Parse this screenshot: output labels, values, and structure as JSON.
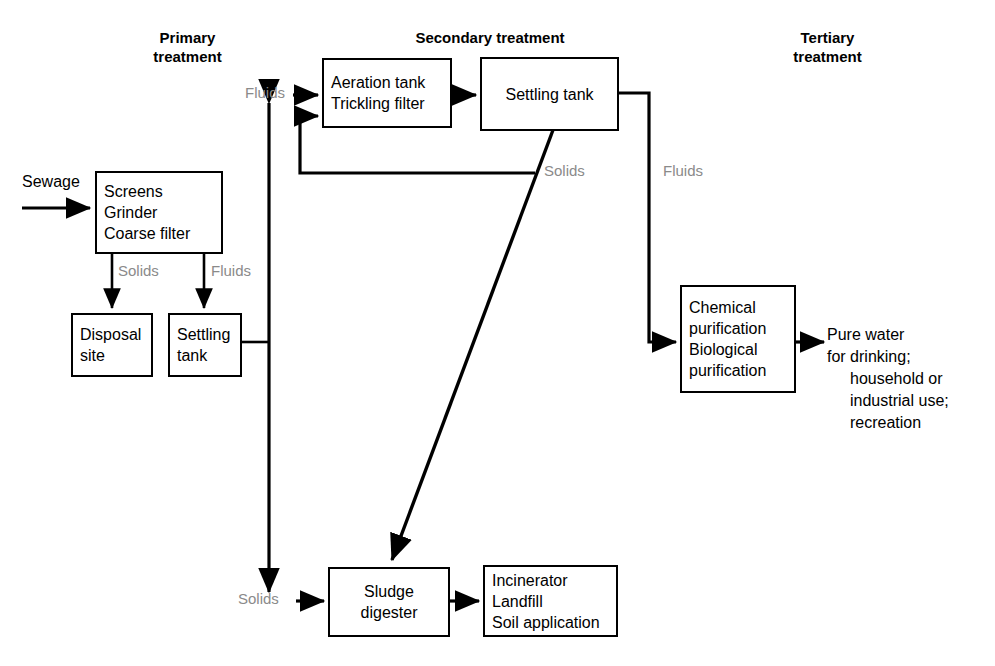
{
  "diagram": {
    "colors": {
      "stroke": "#000000",
      "label_gray": "#8a8a8a",
      "background": "#ffffff"
    },
    "sections": [
      {
        "id": "primary",
        "label": "Primary\ntreatment"
      },
      {
        "id": "secondary",
        "label": "Secondary treatment"
      },
      {
        "id": "tertiary",
        "label": "Tertiary\ntreatment"
      }
    ],
    "nodes": [
      {
        "id": "screens",
        "lines": [
          "Screens",
          "Grinder",
          "Coarse filter"
        ]
      },
      {
        "id": "disposal",
        "lines": [
          "Disposal",
          "site"
        ]
      },
      {
        "id": "psettling",
        "lines": [
          "Settling",
          "tank"
        ]
      },
      {
        "id": "aeration",
        "lines": [
          "Aeration tank",
          "Trickling filter"
        ]
      },
      {
        "id": "ssettling",
        "lines": [
          "Settling tank"
        ]
      },
      {
        "id": "chemical",
        "lines": [
          "Chemical",
          "purification",
          "Biological",
          "purification"
        ]
      },
      {
        "id": "sludge",
        "lines": [
          "Sludge",
          "digester"
        ]
      },
      {
        "id": "incinerator",
        "lines": [
          "Incinerator",
          "Landfill",
          "Soil application"
        ]
      }
    ],
    "edge_labels": [
      {
        "id": "solids-primary",
        "text": "Solids"
      },
      {
        "id": "fluids-primary",
        "text": "Fluids"
      },
      {
        "id": "fluids-to-aerator",
        "text": "Fluids"
      },
      {
        "id": "solids-secondary",
        "text": "Solids"
      },
      {
        "id": "fluids-tertiary",
        "text": "Fluids"
      },
      {
        "id": "solids-to-sludge",
        "text": "Solids"
      }
    ],
    "io_labels": [
      {
        "id": "sewage-input",
        "text": "Sewage"
      }
    ],
    "output_text": {
      "id": "pure-water-output",
      "line1": "Pure water",
      "line2": "for drinking;",
      "line3": "household or",
      "line4": "industrial use;",
      "line5": "recreation"
    }
  }
}
